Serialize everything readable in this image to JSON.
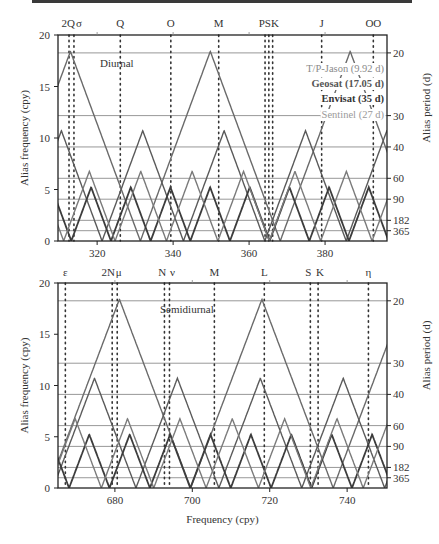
{
  "chart_data": [
    {
      "type": "line",
      "panel": "Diurnal",
      "panel_label": "Diurnal",
      "xlabel": "",
      "ylabel": "Alias frequency (cpy)",
      "ylabel_right": "Alias period (d)",
      "xlim": [
        309.7,
        396.3
      ],
      "ylim": [
        0,
        20
      ],
      "x_ticks": [
        320,
        340,
        360,
        380
      ],
      "y_ticks": [
        0,
        5,
        10,
        15,
        20
      ],
      "right_ticks_period_days": [
        20,
        30,
        40,
        60,
        90,
        182,
        365
      ],
      "grid": "horizontal lines at alias periods",
      "tides": [
        {
          "name": "2Q",
          "freq": 312.6
        },
        {
          "name": "σ",
          "freq": 313.9
        },
        {
          "name": "Q",
          "freq": 326.1
        },
        {
          "name": "O",
          "freq": 339.4
        },
        {
          "name": "M",
          "freq": 352.0
        },
        {
          "name": "P",
          "freq": 364.2
        },
        {
          "name": "S",
          "freq": 365.2
        },
        {
          "name": "K",
          "freq": 366.2
        },
        {
          "name": "J",
          "freq": 379.1
        },
        {
          "name": "OO",
          "freq": 392.7
        }
      ],
      "tide_labels": [
        {
          "text": "2Q",
          "freq": 312.4
        },
        {
          "text": "σ",
          "freq": 315.2
        },
        {
          "text": "Q",
          "freq": 326.1
        },
        {
          "text": "O",
          "freq": 339.4
        },
        {
          "text": "M",
          "freq": 352.0
        },
        {
          "text": "PSK",
          "freq": 365.2
        },
        {
          "text": "J",
          "freq": 379.1
        },
        {
          "text": "OO",
          "freq": 392.7
        }
      ],
      "series": [
        {
          "name": "T/P-Jason (9.92 d)",
          "repeat_days": 9.92,
          "sampling_cpy": 36.82,
          "nyquist_cpy": 18.41
        },
        {
          "name": "Geosat (17.05 d)",
          "repeat_days": 17.05,
          "sampling_cpy": 21.42,
          "nyquist_cpy": 10.71
        },
        {
          "name": "Envisat (35 d)",
          "repeat_days": 35,
          "sampling_cpy": 10.44,
          "nyquist_cpy": 5.22
        },
        {
          "name": "Sentinel (27 d)",
          "repeat_days": 27,
          "sampling_cpy": 13.53,
          "nyquist_cpy": 6.76
        }
      ],
      "legend_position": "upper right"
    },
    {
      "type": "line",
      "panel": "Semidiurnal",
      "panel_label": "Semidiurnal",
      "xlabel": "Frequency (cpy)",
      "ylabel": "Alias frequency (cpy)",
      "ylabel_right": "Alias period (d)",
      "xlim": [
        665.3,
        750.3
      ],
      "ylim": [
        0,
        20
      ],
      "x_ticks": [
        680,
        700,
        720,
        740
      ],
      "y_ticks": [
        0,
        5,
        10,
        15,
        20
      ],
      "right_ticks_period_days": [
        20,
        30,
        40,
        60,
        90,
        182,
        365
      ],
      "grid": "horizontal lines at alias periods",
      "tides": [
        {
          "name": "ε",
          "freq": 667.2
        },
        {
          "name": "2N",
          "freq": 679.3
        },
        {
          "name": "μ",
          "freq": 680.6
        },
        {
          "name": "N",
          "freq": 692.8
        },
        {
          "name": "ν",
          "freq": 694.1
        },
        {
          "name": "M",
          "freq": 705.7
        },
        {
          "name": "L",
          "freq": 718.6
        },
        {
          "name": "S",
          "freq": 730.5
        },
        {
          "name": "K",
          "freq": 732.5
        },
        {
          "name": "η",
          "freq": 745.5
        }
      ],
      "tide_labels": [
        {
          "text": "ε",
          "freq": 667.2
        },
        {
          "text": "2N",
          "freq": 678.3
        },
        {
          "text": "μ",
          "freq": 681.0
        },
        {
          "text": "N",
          "freq": 692.2
        },
        {
          "text": "ν",
          "freq": 694.9
        },
        {
          "text": "M",
          "freq": 705.7
        },
        {
          "text": "L",
          "freq": 718.6
        },
        {
          "text": "S",
          "freq": 730.0
        },
        {
          "text": "K",
          "freq": 733.0
        },
        {
          "text": "η",
          "freq": 745.5
        }
      ],
      "series": [
        {
          "name": "T/P-Jason (9.92 d)",
          "repeat_days": 9.92,
          "sampling_cpy": 36.82,
          "nyquist_cpy": 18.41
        },
        {
          "name": "Geosat (17.05 d)",
          "repeat_days": 17.05,
          "sampling_cpy": 21.42,
          "nyquist_cpy": 10.71
        },
        {
          "name": "Envisat (35 d)",
          "repeat_days": 35,
          "sampling_cpy": 10.44,
          "nyquist_cpy": 5.22
        },
        {
          "name": "Sentinel (27 d)",
          "repeat_days": 27,
          "sampling_cpy": 13.53,
          "nyquist_cpy": 6.76
        }
      ]
    }
  ],
  "legend": {
    "items": [
      {
        "label": "T/P-Jason (9.92 d)",
        "color": "#8a8a8a"
      },
      {
        "label": "Geosat (17.05 d)",
        "color": "#555555"
      },
      {
        "label": "Envisat (35 d)",
        "color": "#333333"
      },
      {
        "label": "Sentinel (27 d)",
        "color": "#9a9a9a"
      }
    ]
  },
  "styles": {
    "series_colors": [
      "#6a6a6a",
      "#5a5a5a",
      "#3c3c3c",
      "#7a7a7a"
    ],
    "grid_color": "#8c8c8c",
    "axis_color": "#222222"
  }
}
